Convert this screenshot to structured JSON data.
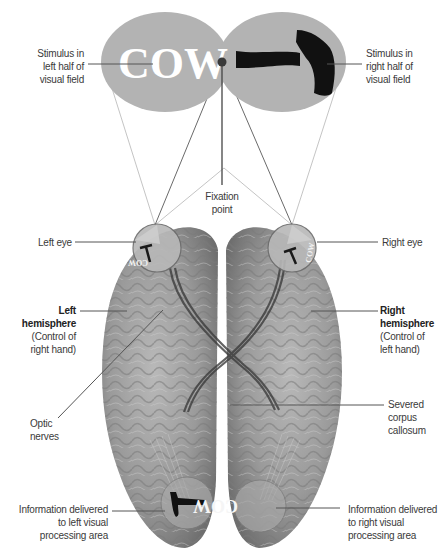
{
  "diagram": {
    "colors": {
      "visual_field": "#b3b3b3",
      "brain": "#8c8c8c",
      "leader_line": "#555555",
      "sight_line": "#b0b0b0",
      "text": "#3a3a3a"
    },
    "stimuli": {
      "left_word": "COW",
      "right_icon": "hammer-icon",
      "left_brain_word_mirrored": "COW"
    },
    "labels": {
      "stimulus_left": [
        "Stimulus in",
        "left half of",
        "visual field"
      ],
      "stimulus_right": [
        "Stimulus in",
        "right half of",
        "visual field"
      ],
      "fixation": [
        "Fixation",
        "point"
      ],
      "left_eye": "Left eye",
      "right_eye": "Right eye",
      "left_hemisphere_title": [
        "Left",
        "hemisphere"
      ],
      "left_hemisphere_sub": [
        "(Control of",
        "right hand)"
      ],
      "right_hemisphere_title": [
        "Right",
        "hemisphere"
      ],
      "right_hemisphere_sub": [
        "(Control of",
        "left hand)"
      ],
      "optic_nerves": [
        "Optic",
        "nerves"
      ],
      "corpus_callosum": [
        "Severed",
        "corpus",
        "callosum"
      ],
      "info_left": [
        "Information delivered",
        "to left visual",
        "processing area"
      ],
      "info_right": [
        "Information delivered",
        "to right visual",
        "processing area"
      ]
    }
  }
}
